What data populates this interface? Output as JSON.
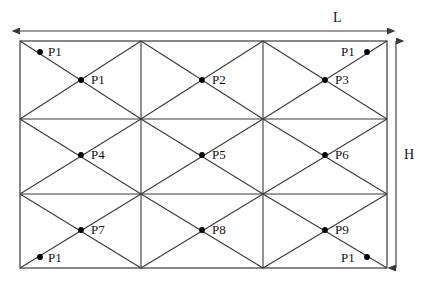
{
  "figure": {
    "type": "triangular-mesh-panel-diagram",
    "background_color": "#ffffff",
    "line_color": "#3a3a3a",
    "text_color": "#111111",
    "marker_color": "#000000"
  },
  "panel": {
    "x": 20,
    "y": 41,
    "width": 367,
    "height": 227,
    "columns": 3,
    "rows": 3,
    "vertical_dividers_x": [
      141,
      263
    ],
    "horizontal_dividers_y": [
      119,
      194
    ],
    "cell_pattern": "x-diagonals"
  },
  "dimensions": {
    "length": {
      "label": "L",
      "label_x": 333,
      "label_y": 11,
      "arrow_y": 31,
      "arrow_x1": 20,
      "arrow_x2": 387,
      "orientation": "horizontal",
      "double_headed": true
    },
    "height": {
      "label": "H",
      "label_x": 404,
      "label_y": 148,
      "arrow_x": 396,
      "arrow_y1": 41,
      "arrow_y2": 268,
      "orientation": "vertical",
      "double_headed": true
    }
  },
  "interior_nodes": [
    {
      "label": "P1",
      "dot_x": 81,
      "dot_y": 80,
      "label_x": 91,
      "label_y": 73
    },
    {
      "label": "P2",
      "dot_x": 202,
      "dot_y": 80,
      "label_x": 212,
      "label_y": 73
    },
    {
      "label": "P3",
      "dot_x": 325,
      "dot_y": 80,
      "label_x": 335,
      "label_y": 73
    },
    {
      "label": "P4",
      "dot_x": 81,
      "dot_y": 155,
      "label_x": 91,
      "label_y": 148
    },
    {
      "label": "P5",
      "dot_x": 202,
      "dot_y": 155,
      "label_x": 212,
      "label_y": 148
    },
    {
      "label": "P6",
      "dot_x": 325,
      "dot_y": 155,
      "label_x": 335,
      "label_y": 148
    },
    {
      "label": "P7",
      "dot_x": 81,
      "dot_y": 230,
      "label_x": 91,
      "label_y": 223
    },
    {
      "label": "P8",
      "dot_x": 202,
      "dot_y": 230,
      "label_x": 212,
      "label_y": 223
    },
    {
      "label": "P9",
      "dot_x": 325,
      "dot_y": 230,
      "label_x": 335,
      "label_y": 223
    }
  ],
  "corner_nodes": [
    {
      "label": "P1",
      "position": "top-left",
      "dot_x": 40,
      "dot_y": 52,
      "label_x": 48,
      "label_y": 45
    },
    {
      "label": "P1",
      "position": "top-right",
      "dot_x": 367,
      "dot_y": 52,
      "label_x": 341,
      "label_y": 45
    },
    {
      "label": "P1",
      "position": "bottom-left",
      "dot_x": 40,
      "dot_y": 257,
      "label_x": 48,
      "label_y": 251
    },
    {
      "label": "P1",
      "position": "bottom-right",
      "dot_x": 367,
      "dot_y": 257,
      "label_x": 341,
      "label_y": 251
    }
  ]
}
